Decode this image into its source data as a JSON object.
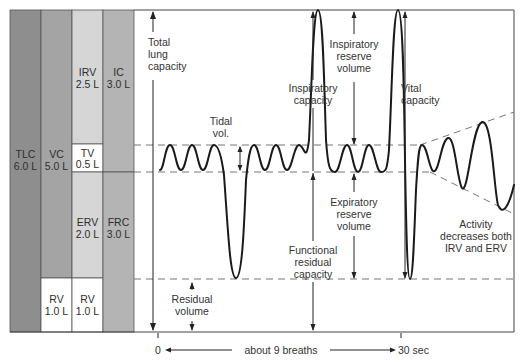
{
  "columns": {
    "tlc": {
      "name": "TLC",
      "value": "6.0 L"
    },
    "vc": {
      "name": "VC",
      "value": "5.0 L"
    },
    "irv": {
      "name": "IRV",
      "value": "2.5 L"
    },
    "tv": {
      "name": "TV",
      "value": "0.5 L"
    },
    "erv": {
      "name": "ERV",
      "value": "2.0 L"
    },
    "rv1": {
      "name": "RV",
      "value": "1.0 L"
    },
    "rv2": {
      "name": "RV",
      "value": "1.0 L"
    },
    "ic": {
      "name": "IC",
      "value": "3.0 L"
    },
    "frc": {
      "name": "FRC",
      "value": "3.0 L"
    }
  },
  "colors": {
    "tlc": "#8e8e8e",
    "vc": "#a4a4a4",
    "irv_erv": "#d6d6d6",
    "ic_frc": "#b4b4b4",
    "white": "#ffffff"
  },
  "labels": {
    "total_lung_capacity": [
      "Total",
      "lung",
      "capacity"
    ],
    "tidal_vol": [
      "Tidal",
      "vol."
    ],
    "inspiratory_capacity": [
      "Inspiratory",
      "capacity"
    ],
    "inspiratory_reserve_volume": [
      "Inspiratory",
      "reserve",
      "volume"
    ],
    "vital_capacity": [
      "Vital",
      "capacity"
    ],
    "expiratory_reserve_volume": [
      "Expiratory",
      "reserve",
      "volume"
    ],
    "functional_residual_capacity": [
      "Functional",
      "residual",
      "capacity"
    ],
    "residual_volume": [
      "Residual",
      "volume"
    ],
    "activity_note": [
      "Activity",
      "decreases both",
      "IRV and ERV"
    ]
  },
  "axis": {
    "start": "0",
    "middle": "about 9 breaths",
    "end": "30 sec"
  }
}
